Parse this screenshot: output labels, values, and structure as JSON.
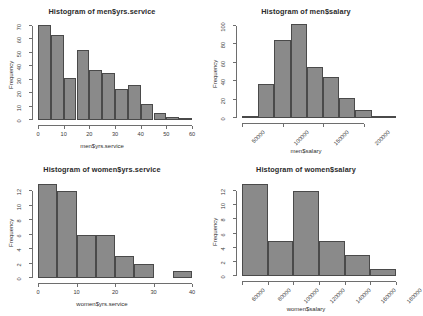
{
  "figure": {
    "layout": "2x2 grid of histograms",
    "background": "#ffffff",
    "bar_fill": "#8a8a8a",
    "bar_border": "#4a4a4a",
    "axis_color": "#6e6e6e",
    "ylabel_common": "Frequency"
  },
  "chart_data": [
    {
      "type": "bar",
      "id": "men-yrs-service",
      "title": "Histogram of men$yrs.service",
      "xlabel": "men$yrs.service",
      "ylabel": "Frequency",
      "xlim": [
        0,
        60
      ],
      "ylim": [
        0,
        70
      ],
      "xticks": [
        0,
        10,
        20,
        30,
        40,
        50,
        60
      ],
      "xtick_labels": [
        "0",
        "10",
        "20",
        "30",
        "40",
        "50",
        "60"
      ],
      "yticks": [
        0,
        10,
        20,
        30,
        40,
        50,
        60,
        70
      ],
      "ytick_labels": [
        "0",
        "10",
        "20",
        "30",
        "40",
        "50",
        "60",
        "70"
      ],
      "bin_width": 5,
      "bin_edges": [
        0,
        5,
        10,
        15,
        20,
        25,
        30,
        35,
        40,
        45,
        50,
        55,
        60
      ],
      "values": [
        71,
        63,
        31,
        52,
        37,
        35,
        23,
        26,
        12,
        5,
        2,
        1
      ],
      "grid": false,
      "legend": false
    },
    {
      "type": "bar",
      "id": "men-salary",
      "title": "Histogram of men$salary",
      "xlabel": "men$salary",
      "ylabel": "Frequency",
      "xlim": [
        50000,
        240000
      ],
      "ylim": [
        0,
        100
      ],
      "xticks": [
        50000,
        100000,
        150000,
        200000
      ],
      "xtick_labels": [
        "50000",
        "100000",
        "150000",
        "200000"
      ],
      "yticks": [
        0,
        20,
        40,
        60,
        80,
        100
      ],
      "ytick_labels": [
        "0",
        "20",
        "40",
        "60",
        "80",
        "100"
      ],
      "bin_width": 20000,
      "bin_edges": [
        50000,
        70000,
        90000,
        110000,
        130000,
        150000,
        170000,
        190000,
        210000,
        230000,
        240000
      ],
      "values": [
        2,
        37,
        85,
        102,
        55,
        45,
        22,
        9,
        2,
        1
      ],
      "grid": false,
      "legend": false
    },
    {
      "type": "bar",
      "id": "women-yrs-service",
      "title": "Histogram of women$yrs.service",
      "xlabel": "women$yrs.service",
      "ylabel": "Frequency",
      "xlim": [
        0,
        40
      ],
      "ylim": [
        0,
        13
      ],
      "xticks": [
        0,
        10,
        20,
        30,
        40
      ],
      "xtick_labels": [
        "0",
        "10",
        "20",
        "30",
        "40"
      ],
      "yticks": [
        0,
        2,
        4,
        6,
        8,
        10,
        12
      ],
      "ytick_labels": [
        "0",
        "2",
        "4",
        "6",
        "8",
        "10",
        "12"
      ],
      "bin_width": 5,
      "bin_edges": [
        0,
        5,
        10,
        15,
        20,
        25,
        30,
        35,
        40
      ],
      "values": [
        13,
        12,
        6,
        6,
        3,
        2,
        0,
        1
      ],
      "grid": false,
      "legend": false
    },
    {
      "type": "bar",
      "id": "women-salary",
      "title": "Histogram of women$salary",
      "xlabel": "women$salary",
      "ylabel": "Frequency",
      "xlim": [
        60000,
        180000
      ],
      "ylim": [
        0,
        13
      ],
      "xticks": [
        60000,
        80000,
        100000,
        120000,
        140000,
        160000,
        180000
      ],
      "xtick_labels": [
        "60000",
        "80000",
        "100000",
        "120000",
        "140000",
        "160000",
        "180000"
      ],
      "yticks": [
        0,
        2,
        4,
        6,
        8,
        10,
        12
      ],
      "ytick_labels": [
        "0",
        "2",
        "4",
        "6",
        "8",
        "10",
        "12"
      ],
      "bin_width": 20000,
      "bin_edges": [
        60000,
        80000,
        100000,
        120000,
        140000,
        160000,
        180000
      ],
      "values": [
        13,
        5,
        12,
        5,
        3,
        1
      ],
      "grid": false,
      "legend": false
    }
  ]
}
